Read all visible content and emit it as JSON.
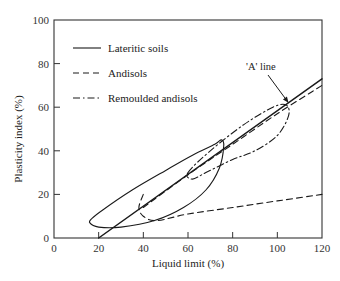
{
  "chart_data": {
    "type": "line",
    "title": "",
    "xlabel": "Liquid limit (%)",
    "ylabel": "Plasticity index (%)",
    "xlim": [
      0,
      120
    ],
    "ylim": [
      0,
      100
    ],
    "x_ticks": [
      0,
      20,
      40,
      60,
      80,
      100,
      120
    ],
    "y_ticks": [
      0,
      20,
      40,
      60,
      80,
      100
    ],
    "grid": false,
    "legend_position": "upper left",
    "legend": [
      {
        "label": "Lateritic soils",
        "style": "solid"
      },
      {
        "label": "Andisols",
        "style": "dashed"
      },
      {
        "label": "Remoulded andisols",
        "style": "dash-dot"
      }
    ],
    "annotations": [
      {
        "text": "'A' line",
        "points_to": [
          105,
          62
        ]
      }
    ],
    "series": [
      {
        "name": "'A' line",
        "style": "solid",
        "x": [
          20,
          120
        ],
        "y": [
          0,
          73
        ]
      },
      {
        "name": "Lateritic soils (envelope)",
        "style": "solid",
        "closed": true,
        "x": [
          17,
          22,
          35,
          50,
          62,
          72,
          75,
          76,
          74,
          68,
          58,
          45,
          30,
          20,
          16,
          17
        ],
        "y": [
          9,
          13,
          22,
          31,
          38,
          43,
          45,
          42,
          32,
          22,
          14,
          8,
          5,
          5,
          7,
          9
        ]
      },
      {
        "name": "Andisols (envelope)",
        "style": "dashed",
        "closed_lower_left": true,
        "x": [
          40,
          38,
          40,
          46,
          60,
          80,
          100,
          120
        ],
        "y": [
          20,
          14,
          10,
          8,
          11,
          14,
          17,
          20
        ]
      },
      {
        "name": "Andisols (upper, along A-line)",
        "style": "dashed",
        "x": [
          40,
          60,
          80,
          100,
          120
        ],
        "y": [
          14,
          29,
          43,
          57,
          70
        ]
      },
      {
        "name": "Remoulded andisols (envelope)",
        "style": "dash-dot",
        "closed": true,
        "x": [
          60,
          70,
          85,
          98,
          104,
          105,
          100,
          90,
          80,
          68,
          62,
          60
        ],
        "y": [
          30,
          40,
          52,
          60,
          61,
          56,
          47,
          40,
          36,
          30,
          27,
          30
        ]
      }
    ]
  }
}
